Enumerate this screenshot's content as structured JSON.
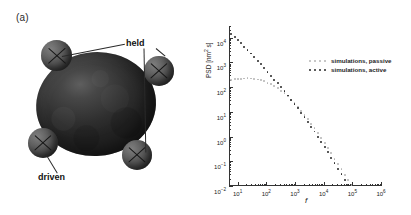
{
  "figure": {
    "panel_a_tag": "(a)",
    "panel_b_tag": "(b)"
  },
  "schematic": {
    "label_held": "held",
    "label_driven": "driven",
    "beads": [
      {
        "name": "bead-held-top-left",
        "role": "held"
      },
      {
        "name": "bead-held-right",
        "role": "held"
      },
      {
        "name": "bead-driven-bottom-left",
        "role": "driven"
      },
      {
        "name": "bead-driven-bottom-right",
        "role": "driven"
      }
    ],
    "cell_name": "cell-body"
  },
  "chart_data": {
    "type": "line",
    "title": "",
    "xlabel": "f",
    "ylabel": "PSD [nm² s]",
    "xscale": "log",
    "yscale": "log",
    "xlim": [
      5,
      1000000
    ],
    "ylim": [
      0.01,
      30000
    ],
    "grid": false,
    "legend_position": "upper-right-inside",
    "x_tick_labels": [
      "10⁰",
      "10¹",
      "10²",
      "10³",
      "10⁴",
      "10⁵",
      "10⁶"
    ],
    "x_ticks": [
      1,
      10,
      100,
      1000,
      10000,
      100000,
      1000000
    ],
    "y_tick_labels": [
      "10⁻²",
      "10⁻¹",
      "10⁰",
      "10¹",
      "10²",
      "10³",
      "10⁴"
    ],
    "y_ticks": [
      0.01,
      0.1,
      1,
      10,
      100,
      1000,
      10000
    ],
    "series": [
      {
        "name": "simulations, passive",
        "color": "#b4b4b4",
        "marker": "dot",
        "x": [
          6,
          8,
          10,
          13,
          17,
          22,
          29,
          38,
          50,
          65,
          85,
          110,
          145,
          190,
          250,
          330,
          430,
          560,
          730,
          960,
          1250,
          1650,
          2150,
          2800,
          3700,
          4800,
          6300,
          8200,
          11000,
          14000,
          18500,
          24000,
          32000,
          42000,
          55000,
          72000,
          94000,
          123000,
          160000,
          210000,
          275000,
          360000,
          470000,
          615000,
          805000,
          1000000
        ],
        "y": [
          200,
          210,
          215,
          220,
          225,
          228,
          225,
          218,
          205,
          190,
          172,
          152,
          130,
          110,
          90,
          72,
          56,
          42,
          31,
          22,
          15.5,
          10.8,
          7.4,
          5.0,
          3.3,
          2.15,
          1.38,
          0.88,
          0.55,
          0.34,
          0.21,
          0.128,
          0.078,
          0.047,
          0.029,
          0.0175,
          0.0106,
          0.0064,
          0.0039,
          0.0024,
          0.00145,
          0.00088,
          0.00053,
          0.00032,
          0.0002,
          0.00012
        ]
      },
      {
        "name": "simulations, active",
        "color": "#262626",
        "marker": "dot",
        "x": [
          6,
          8,
          10,
          13,
          17,
          22,
          29,
          38,
          50,
          65,
          85,
          110,
          145,
          190,
          250,
          330,
          430,
          560,
          730,
          960,
          1250,
          1650,
          2150,
          2800,
          3700,
          4800,
          6300,
          8200,
          11000,
          14000,
          18500,
          24000,
          32000,
          42000,
          55000,
          72000,
          94000,
          123000,
          160000,
          210000,
          275000,
          360000,
          470000,
          615000,
          805000,
          1000000
        ],
        "y": [
          14000,
          10500,
          8200,
          6000,
          4400,
          3200,
          2300,
          1650,
          1180,
          840,
          590,
          415,
          290,
          203,
          142,
          99,
          68,
          46,
          31,
          21,
          14,
          9.2,
          6.0,
          3.9,
          2.5,
          1.6,
          1.0,
          0.62,
          0.38,
          0.23,
          0.14,
          0.084,
          0.05,
          0.03,
          0.018,
          0.0107,
          0.0064,
          0.0038,
          0.0023,
          0.00138,
          0.00083,
          0.0005,
          0.0003,
          0.00018,
          0.00011,
          6.5e-05
        ]
      }
    ],
    "legend": [
      {
        "label": "simulations, passive",
        "color": "#b4b4b4"
      },
      {
        "label": "simulations, active",
        "color": "#262626"
      }
    ]
  }
}
